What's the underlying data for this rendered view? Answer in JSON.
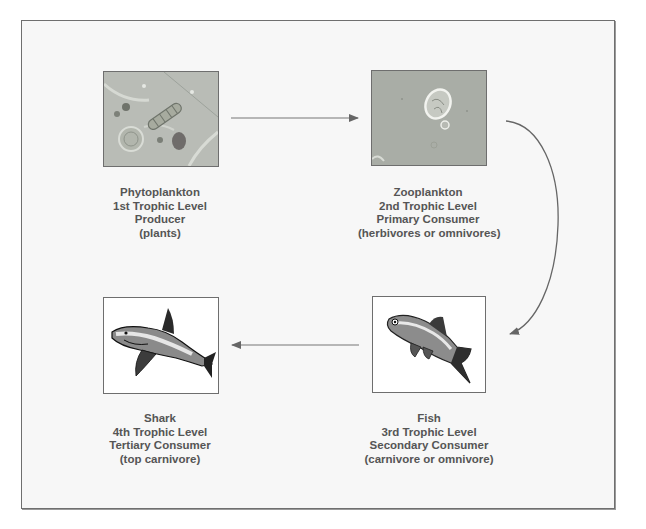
{
  "diagram": {
    "type": "food-chain",
    "nodes": [
      {
        "id": "phytoplankton",
        "name": "Phytoplankton",
        "level": "1st Trophic Level",
        "role": "Producer",
        "note": "(plants)",
        "icon": "phytoplankton-micrograph-icon"
      },
      {
        "id": "zooplankton",
        "name": "Zooplankton",
        "level": "2nd Trophic Level",
        "role": "Primary Consumer",
        "note": "(herbivores or omnivores)",
        "icon": "zooplankton-micrograph-icon"
      },
      {
        "id": "fish",
        "name": "Fish",
        "level": "3rd Trophic Level",
        "role": "Secondary Consumer",
        "note": "(carnivore or omnivore)",
        "icon": "fish-drawing-icon"
      },
      {
        "id": "shark",
        "name": "Shark",
        "level": "4th Trophic Level",
        "role": "Tertiary Consumer",
        "note": "(top carnivore)",
        "icon": "shark-drawing-icon"
      }
    ],
    "edges": [
      {
        "from": "phytoplankton",
        "to": "zooplankton",
        "style": "straight-arrow"
      },
      {
        "from": "zooplankton",
        "to": "fish",
        "style": "curved-arrow"
      },
      {
        "from": "fish",
        "to": "shark",
        "style": "straight-arrow"
      }
    ],
    "colors": {
      "frame_bg": "#f7f7f7",
      "frame_border": "#6f6f6f",
      "text": "#555555",
      "arrow": "#666666",
      "photo_bg": "#b7bbb4"
    }
  }
}
